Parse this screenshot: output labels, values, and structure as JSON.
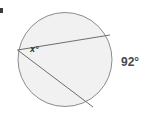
{
  "figure": {
    "background_color": "#ffffff",
    "corner_mark": {
      "name": "corner-tick-mark",
      "color": "#3c3c3c"
    }
  },
  "circle": {
    "center_x": 65,
    "center_y": 59.5,
    "radius": 47,
    "fill_color": "#f1f1f1",
    "stroke_color": "#8c8c8c",
    "stroke_width": 1
  },
  "points": {
    "vertex": {
      "label": "vertex",
      "x": 17.5,
      "y": 50
    },
    "upper_chord_end": {
      "label": "upper-endpoint",
      "x": 110,
      "y": 35
    },
    "lower_chord_end": {
      "label": "lower-endpoint",
      "x": 93,
      "y": 107
    }
  },
  "chords": [
    {
      "name": "upper-chord",
      "x1": 17.5,
      "y1": 50,
      "x2": 110,
      "y2": 35,
      "stroke_color": "#6e6e6e",
      "stroke_width": 1
    },
    {
      "name": "lower-chord",
      "x1": 17.5,
      "y1": 50,
      "x2": 93,
      "y2": 107,
      "stroke_color": "#6e6e6e",
      "stroke_width": 1
    }
  ],
  "labels": {
    "unknown_angle": {
      "text": "x°",
      "color": "#2e2e2e",
      "style": "italic"
    },
    "arc_measure": {
      "text": "92°",
      "color": "#4a4a4a",
      "style": "normal"
    }
  },
  "chart_data": {
    "type": "diagram",
    "shape": "circle",
    "given_values": [
      {
        "name": "arc_measure",
        "value": 92,
        "unit": "degrees",
        "label": "92°"
      }
    ],
    "unknown_values": [
      {
        "name": "inscribed_angle",
        "value": null,
        "unit": "degrees",
        "label": "x°"
      }
    ],
    "annotations": [
      "x°",
      "92°"
    ]
  }
}
